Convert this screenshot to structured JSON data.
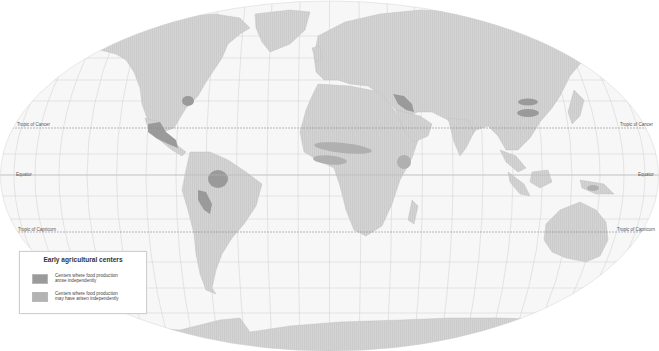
{
  "legend": {
    "title": "Early agricultural centers",
    "items": [
      {
        "label_line1": "Centers where food production",
        "label_line2": "arose independently",
        "color": "#9a9a9a"
      },
      {
        "label_line1": "Centers where food production",
        "label_line2": "may have arisen independently",
        "color": "#b3b3b3"
      }
    ]
  },
  "latitude_lines": {
    "tropic_of_cancer": "Tropic of Cancer",
    "equator": "Equator",
    "tropic_of_capricorn": "Tropic of Capricorn"
  },
  "colors": {
    "land": "#d3d3d3",
    "ocean": "#f6f6f6",
    "graticule": "#c9c9c9",
    "center_independent": "#9a9a9a",
    "center_possible": "#b3b3b3"
  },
  "agricultural_centers": [
    {
      "region": "Eastern North America",
      "type": "independent"
    },
    {
      "region": "Mesoamerica",
      "type": "independent"
    },
    {
      "region": "Amazonia",
      "type": "independent"
    },
    {
      "region": "Andes",
      "type": "independent"
    },
    {
      "region": "Fertile Crescent",
      "type": "independent"
    },
    {
      "region": "Sahel",
      "type": "possible"
    },
    {
      "region": "West Africa",
      "type": "possible"
    },
    {
      "region": "Ethiopia",
      "type": "possible"
    },
    {
      "region": "North China",
      "type": "independent"
    },
    {
      "region": "South China (Yangtze)",
      "type": "independent"
    },
    {
      "region": "New Guinea",
      "type": "independent"
    }
  ]
}
